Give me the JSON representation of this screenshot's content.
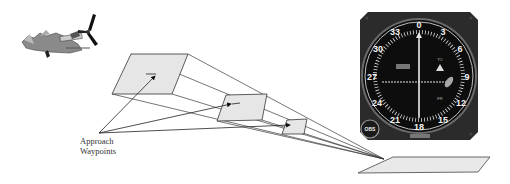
{
  "diagram": {
    "annotation": {
      "line1": "Approach",
      "line2": "Waypoints"
    },
    "instrument": {
      "compass_labels": [
        "0",
        "3",
        "6",
        "9",
        "12",
        "15",
        "18",
        "21",
        "24",
        "27",
        "30",
        "33"
      ],
      "obs_knob_label": "OBS",
      "flag_to": "TO",
      "flag_fr": "FR",
      "brand": "GARMIN"
    },
    "waypoints": [
      {
        "id": "waypoint-1"
      },
      {
        "id": "waypoint-2"
      },
      {
        "id": "waypoint-3"
      }
    ],
    "colors": {
      "box_fill": "#e6e6e6",
      "line": "#333333",
      "bezel": "#2b2b2b",
      "dial_face": "#0d0d0d",
      "dial_text": "#f2f2f2"
    }
  }
}
